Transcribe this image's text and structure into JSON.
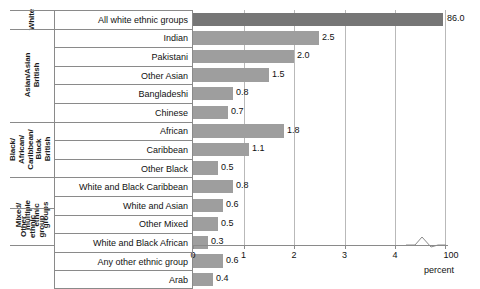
{
  "chart_data": {
    "type": "bar",
    "orientation": "horizontal",
    "title": "",
    "xlabel": "percent",
    "ylabel": "",
    "xlim": [
      0,
      4.6
    ],
    "xticks": [
      0,
      1,
      2,
      3,
      4
    ],
    "xtick_labels": [
      "0",
      "1",
      "2",
      "3",
      "4",
      "100"
    ],
    "axis_break": true,
    "axis_break_note": "broken x-axis between 4 and 100",
    "grid": "vertical",
    "legend": "none",
    "categories": [
      "All white ethnic groups",
      "Indian",
      "Pakistani",
      "Other Asian",
      "Bangladeshi",
      "Chinese",
      "African",
      "Caribbean",
      "Other Black",
      "White and Black Caribbean",
      "White and Asian",
      "Other Mixed",
      "White and Black African",
      "Any other ethnic group",
      "Arab"
    ],
    "values": [
      86.0,
      2.5,
      2.0,
      1.5,
      0.8,
      0.7,
      1.8,
      1.1,
      0.5,
      0.8,
      0.6,
      0.5,
      0.3,
      0.6,
      0.4
    ],
    "value_labels": [
      "86.0",
      "2.5",
      "2.0",
      "1.5",
      "0.8",
      "0.7",
      "1.8",
      "1.1",
      "0.5",
      "0.8",
      "0.6",
      "0.5",
      "0.3",
      "0.6",
      "0.4"
    ],
    "bar_colors": [
      "#767676",
      "#9e9e9e",
      "#9e9e9e",
      "#9e9e9e",
      "#9e9e9e",
      "#9e9e9e",
      "#9e9e9e",
      "#9e9e9e",
      "#9e9e9e",
      "#9e9e9e",
      "#9e9e9e",
      "#9e9e9e",
      "#9e9e9e",
      "#9e9e9e",
      "#9e9e9e"
    ],
    "groups": [
      {
        "label": "White",
        "label_lines": [
          "White"
        ],
        "categories": [
          "All white ethnic groups"
        ]
      },
      {
        "label": "Asian/Asian British",
        "label_lines": [
          "Asian/Asian",
          "British"
        ],
        "categories": [
          "Indian",
          "Pakistani",
          "Other Asian",
          "Bangladeshi",
          "Chinese"
        ]
      },
      {
        "label": "Black/African/Caribbean/Black British",
        "label_lines": [
          "Black/",
          "African/",
          "Caribbean/",
          "Black",
          "British"
        ],
        "categories": [
          "African",
          "Caribbean",
          "Other Black"
        ]
      },
      {
        "label": "Mixed/multiple ethnic groups",
        "label_lines": [
          "Mixed/",
          "multiple",
          "ethnic",
          "groups"
        ],
        "categories": [
          "White and Black Caribbean",
          "White and Asian",
          "Other Mixed",
          "White and Black African"
        ]
      },
      {
        "label": "Other ethnic group",
        "label_lines": [
          "Other",
          "ethnic",
          "group"
        ],
        "categories": [
          "Any other ethnic group",
          "Arab"
        ]
      }
    ]
  },
  "axis": {
    "unit_label": "percent",
    "tick_labels": [
      "0",
      "1",
      "2",
      "3",
      "4",
      "100"
    ]
  },
  "groups": {
    "white": {
      "l0": "White"
    },
    "asian": {
      "l0": "Asian/Asian",
      "l1": "British"
    },
    "black": {
      "l0": "Black/",
      "l1": "African/",
      "l2": "Caribbean/",
      "l3": "Black",
      "l4": "British"
    },
    "mixed": {
      "l0": "Mixed/",
      "l1": "multiple",
      "l2": "ethnic",
      "l3": "groups"
    },
    "other": {
      "l0": "Other",
      "l1": "ethnic",
      "l2": "group"
    }
  },
  "colors": {
    "bar": "#9e9e9e",
    "bar_highlight": "#767676",
    "grid": "#b9b9b9",
    "border": "#8a8a8a",
    "text": "#111111"
  }
}
